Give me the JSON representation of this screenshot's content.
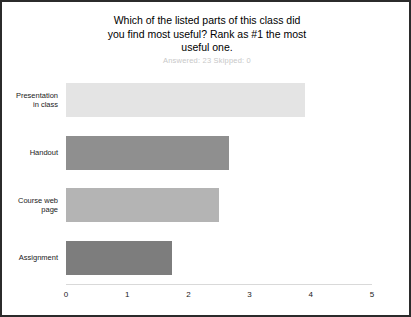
{
  "chart_data": {
    "type": "bar",
    "orientation": "horizontal",
    "title": "Which of the listed parts of this class did you find most useful? Rank as #1 the most useful one.",
    "title_lines": [
      "Which of the listed parts of this class did",
      "you find most useful? Rank as #1 the most",
      "useful one."
    ],
    "subtitle": "Answered: 23   Skipped: 0",
    "answered": 23,
    "skipped": 0,
    "categories": [
      "Presentation in class",
      "Handout",
      "Course web page",
      "Assignment"
    ],
    "category_lines": [
      [
        "Presentation",
        "in class"
      ],
      [
        "Handout"
      ],
      [
        "Course web",
        "page"
      ],
      [
        "Assignment"
      ]
    ],
    "values": [
      3.9,
      2.66,
      2.5,
      1.74
    ],
    "bar_colors": [
      "#e4e4e4",
      "#8f8f8f",
      "#b4b4b4",
      "#7d7d7d"
    ],
    "xlabel": "",
    "ylabel": "",
    "xlim": [
      0,
      5
    ],
    "xticks": [
      0,
      1,
      2,
      3,
      4,
      5
    ],
    "xtick_labels": [
      "0",
      "1",
      "2",
      "3",
      "4",
      "5"
    ],
    "grid": false,
    "legend": false,
    "axis_color": "#d9d9d9",
    "border_color": "#2b2b2b",
    "background": "#ffffff",
    "subtitle_color": "#c8c8c8"
  }
}
